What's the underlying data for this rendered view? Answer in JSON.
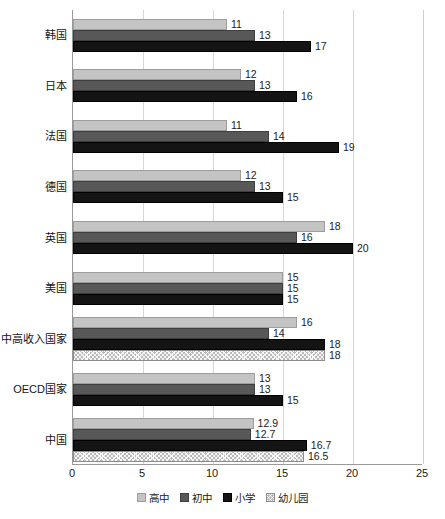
{
  "chart_data": {
    "type": "bar",
    "orientation": "horizontal",
    "title": "",
    "xlabel": "",
    "ylabel": "",
    "xlim": [
      0,
      25
    ],
    "xticks": [
      0,
      5,
      10,
      15,
      20,
      25
    ],
    "grid": true,
    "legend_position": "bottom",
    "categories": [
      "韩国",
      "日本",
      "法国",
      "德国",
      "英国",
      "美国",
      "中高收入国家",
      "OECD国家",
      "中国"
    ],
    "series": [
      {
        "name": "高中",
        "color": "#c4c4c4",
        "values": [
          11,
          12,
          11,
          12,
          18,
          15,
          16,
          13,
          12.9
        ],
        "labels": [
          "11",
          "12",
          "11",
          "12",
          "18",
          "15",
          "16",
          "13",
          "12.9"
        ]
      },
      {
        "name": "初中",
        "color": "#585858",
        "values": [
          13,
          13,
          14,
          13,
          16,
          15,
          14,
          13,
          12.7
        ],
        "labels": [
          "13",
          "13",
          "14",
          "13",
          "16",
          "15",
          "14",
          "13",
          "12.7"
        ]
      },
      {
        "name": "小学",
        "color": "#141414",
        "values": [
          17,
          16,
          19,
          15,
          20,
          15,
          18,
          15,
          16.7
        ],
        "labels": [
          "17",
          "16",
          "19",
          "15",
          "20",
          "15",
          "18",
          "15",
          "16.7"
        ]
      },
      {
        "name": "幼儿园",
        "color": "#b9b9b9",
        "pattern": "crosshatch",
        "values": [
          null,
          null,
          null,
          null,
          null,
          null,
          18,
          null,
          16.5
        ],
        "labels": [
          "",
          "",
          "",
          "",
          "",
          "",
          "18",
          "",
          "16.5"
        ]
      }
    ]
  },
  "legend": {
    "items": [
      {
        "label": "高中",
        "swatch": "s-gaozhong"
      },
      {
        "label": "初中",
        "swatch": "s-chuzhong"
      },
      {
        "label": "小学",
        "swatch": "s-xiaoxue"
      },
      {
        "label": "幼儿园",
        "swatch": "s-youeryuan"
      }
    ]
  }
}
